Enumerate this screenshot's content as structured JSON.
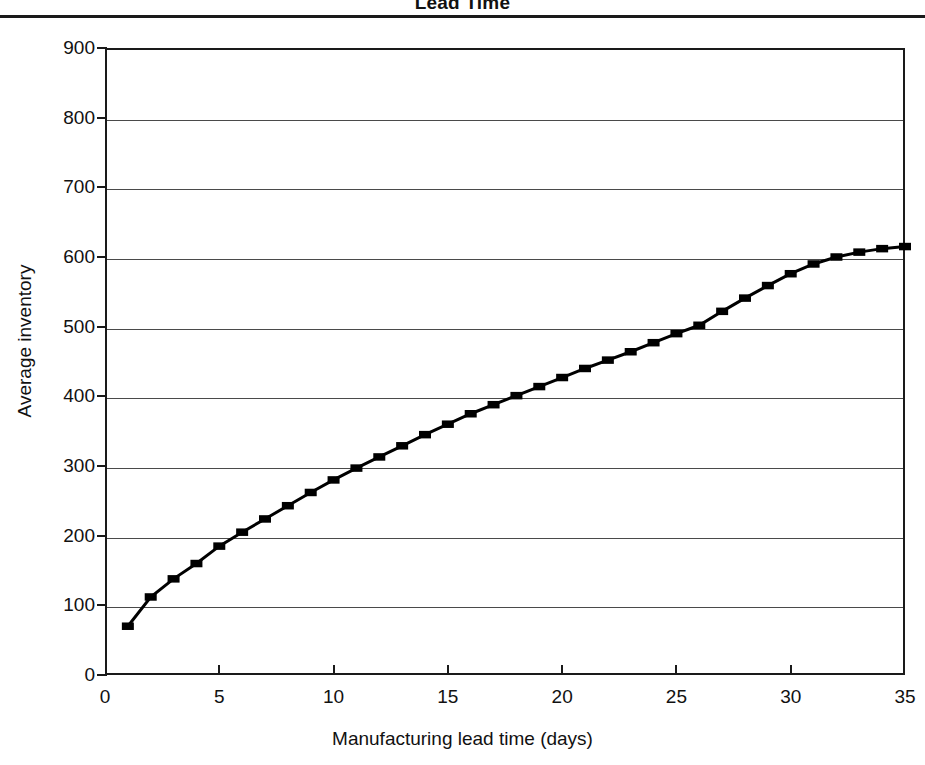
{
  "chart_data": {
    "type": "line",
    "title": "Lead Time",
    "xlabel": "Manufacturing lead time (days)",
    "ylabel": "Average inventory",
    "xlim": [
      0,
      35
    ],
    "ylim": [
      0,
      900
    ],
    "grid": true,
    "legend": "none",
    "marker": "filled-square",
    "line_color": "#000000",
    "xticks": [
      0,
      5,
      10,
      15,
      20,
      25,
      30,
      35
    ],
    "yticks": [
      0,
      100,
      200,
      300,
      400,
      500,
      600,
      700,
      800,
      900
    ],
    "x": [
      1,
      2,
      3,
      4,
      5,
      6,
      7,
      8,
      9,
      10,
      11,
      12,
      13,
      14,
      15,
      16,
      17,
      18,
      19,
      20,
      21,
      22,
      23,
      24,
      25,
      26,
      27,
      28,
      29,
      30,
      31,
      32,
      33,
      34,
      35
    ],
    "values": [
      70,
      112,
      138,
      160,
      185,
      205,
      224,
      243,
      262,
      280,
      297,
      313,
      329,
      345,
      360,
      375,
      388,
      401,
      414,
      427,
      440,
      452,
      464,
      477,
      490,
      502,
      522,
      541,
      559,
      576,
      590,
      600,
      607,
      612,
      615
    ],
    "series": [
      {
        "name": "Average inventory",
        "values": [
          70,
          112,
          138,
          160,
          185,
          205,
          224,
          243,
          262,
          280,
          297,
          313,
          329,
          345,
          360,
          375,
          388,
          401,
          414,
          427,
          440,
          452,
          464,
          477,
          490,
          502,
          522,
          541,
          559,
          576,
          590,
          600,
          607,
          612,
          615
        ]
      }
    ]
  },
  "figure": {
    "title": "Lead Time",
    "axis_title_x": "Manufacturing lead time (days)",
    "axis_title_y": "Average inventory"
  }
}
